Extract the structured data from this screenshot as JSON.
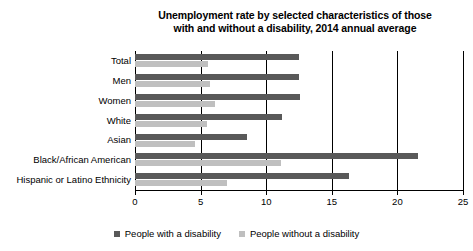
{
  "chart_data": {
    "type": "bar",
    "orientation": "horizontal",
    "title": "Unemployment rate by selected characteristics of those with and without a disability, 2014 annual average",
    "title_lines": [
      "Unemployment rate by selected characteristics of those",
      "with and without a disability, 2014 annual average"
    ],
    "categories": [
      "Total",
      "Men",
      "Women",
      "White",
      "Asian",
      "Black/African American",
      "Hispanic or Latino Ethnicity"
    ],
    "series": [
      {
        "name": "People with a disability",
        "color": "#595959",
        "values": [
          12.5,
          12.5,
          12.6,
          11.2,
          8.5,
          21.6,
          16.3
        ]
      },
      {
        "name": "People without a disability",
        "color": "#bfbfbf",
        "values": [
          5.6,
          5.7,
          6.1,
          5.5,
          4.6,
          11.1,
          7.0
        ]
      }
    ],
    "xlabel": "",
    "ylabel": "",
    "xlim": [
      0,
      25
    ],
    "xticks": [
      0,
      5,
      10,
      15,
      20,
      25
    ],
    "xtick_labels": [
      "0",
      "5",
      "10",
      "15",
      "20",
      "25"
    ],
    "grid": true,
    "grid_axis": "x",
    "legend_position": "bottom"
  },
  "legend": {
    "items": [
      {
        "label": "People with a disability",
        "color": "#595959"
      },
      {
        "label": "People without a disability",
        "color": "#bfbfbf"
      }
    ]
  }
}
